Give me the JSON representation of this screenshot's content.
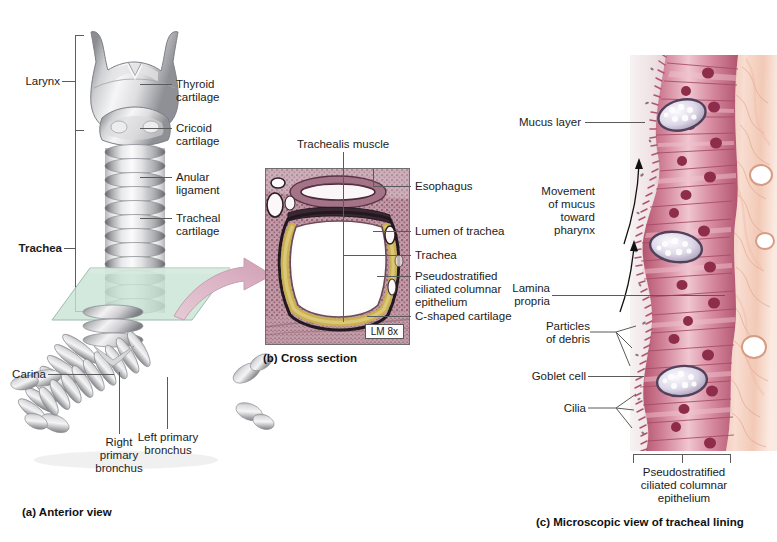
{
  "figure": {
    "background": "#ffffff"
  },
  "panel_a": {
    "caption": "(a) Anterior view",
    "brackets": [
      {
        "name": "larynx",
        "label": "Larynx",
        "bold": false
      },
      {
        "name": "trachea",
        "label": "Trachea",
        "bold": true
      }
    ],
    "labels": [
      {
        "name": "thyroid-cartilage",
        "text": "Thyroid\ncartilage"
      },
      {
        "name": "cricoid-cartilage",
        "text": "Cricoid\ncartilage"
      },
      {
        "name": "anular-ligament",
        "text": "Anular\nligament"
      },
      {
        "name": "tracheal-cartilage",
        "text": "Tracheal\ncartilage"
      },
      {
        "name": "carina",
        "text": "Carina"
      },
      {
        "name": "left-primary-bronchus",
        "text": "Left primary\nbronchus"
      },
      {
        "name": "right-primary-bronchus",
        "text": "Right\nprimary\nbronchus"
      }
    ],
    "section_plane_color": "#c4e1d2",
    "arrow_color": "#dcb8c6"
  },
  "panel_b": {
    "caption": "(b) Cross section",
    "magnification": "LM 8x",
    "labels": [
      {
        "name": "trachealis-muscle",
        "text": "Trachealis muscle"
      },
      {
        "name": "esophagus",
        "text": "Esophagus"
      },
      {
        "name": "lumen-of-trachea",
        "text": "Lumen of trachea"
      },
      {
        "name": "trachea",
        "text": "Trachea"
      },
      {
        "name": "pseudostratified-epithelium",
        "text": "Pseudostratified\nciliated columnar\nepithelium"
      },
      {
        "name": "c-shaped-cartilage",
        "text": "C-shaped cartilage"
      }
    ]
  },
  "panel_c": {
    "caption": "(c) Microscopic view of tracheal lining",
    "bracket_label": "Pseudostratified\nciliated columnar\nepithelium",
    "labels": [
      {
        "name": "mucus-layer",
        "text": "Mucus layer"
      },
      {
        "name": "movement-of-mucus",
        "text": "Movement\nof mucus\ntoward\npharynx"
      },
      {
        "name": "lamina-propria",
        "text": "Lamina\npropria"
      },
      {
        "name": "particles-of-debris",
        "text": "Particles\nof debris"
      },
      {
        "name": "goblet-cell",
        "text": "Goblet cell"
      },
      {
        "name": "cilia",
        "text": "Cilia"
      }
    ],
    "colors": {
      "epithelium": "#c4677f",
      "epithelium_light": "#e8b6c2",
      "nucleus": "#93314f",
      "mucus": "#efe4e6",
      "lamina_propria": "#f2c8b6",
      "goblet": "#e9e5ef"
    }
  }
}
